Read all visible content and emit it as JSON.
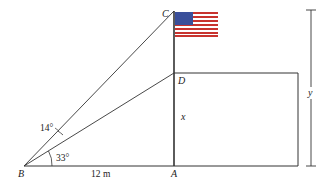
{
  "diagram": {
    "points": {
      "A": "A",
      "B": "B",
      "C": "C",
      "D": "D"
    },
    "labels": {
      "base_distance": "12 m",
      "angle_lower": "33°",
      "angle_upper": "14°",
      "height_building": "x",
      "height_total": "y"
    },
    "colors": {
      "line": "#333333",
      "flag_blue": "#3a4f9a",
      "flag_red": "#c8332e",
      "flag_white": "#ffffff"
    }
  }
}
